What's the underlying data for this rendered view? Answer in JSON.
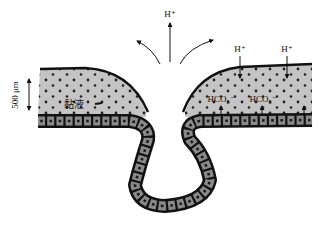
{
  "diagram": {
    "type": "gastric-gland-mucus-bicarbonate-barrier",
    "colors": {
      "mucus_fill": "#c4c4c4",
      "outline": "#111111",
      "cell_fill": "#8a8a8a",
      "nucleus": "#1a1a1a",
      "background": "#ffffff"
    },
    "labels": {
      "scale_bar": "500 μm",
      "mucus": "黏液",
      "proton_top": "H⁺",
      "proton_right_1": "H⁺",
      "proton_right_2": "H⁺",
      "bicarbonate_1": "HCO₃⁻",
      "bicarbonate_2": "HCO₃⁻"
    },
    "arrows": [
      {
        "id": "proton-efflux-up",
        "direction": "up"
      },
      {
        "id": "curved-left",
        "direction": "up-left"
      },
      {
        "id": "curved-right",
        "direction": "up-right"
      },
      {
        "id": "proton-in-1",
        "direction": "down"
      },
      {
        "id": "proton-in-2",
        "direction": "down"
      },
      {
        "id": "bicarbonate-up-1",
        "direction": "up"
      },
      {
        "id": "bicarbonate-up-2",
        "direction": "up"
      },
      {
        "id": "bicarbonate-up-3",
        "direction": "up"
      },
      {
        "id": "scale-bar",
        "direction": "both"
      }
    ]
  }
}
